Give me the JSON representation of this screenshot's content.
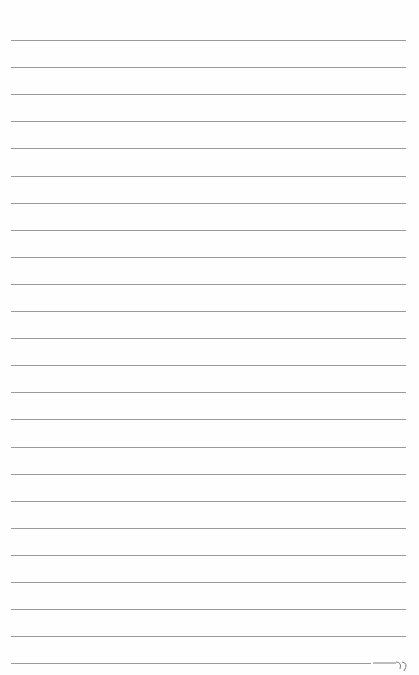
{
  "page": {
    "type": "lined-paper",
    "background": "#fefefe",
    "line_color": "#9a9a9a",
    "line_count": 24,
    "first_line_y": 40,
    "line_spacing": 27.1,
    "line_left": 11,
    "line_width": 395,
    "handwritten_marks": [
      "closing-quote-scribble"
    ]
  }
}
